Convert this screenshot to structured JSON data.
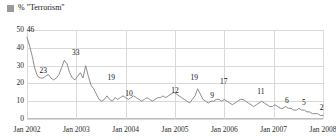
{
  "legend": {
    "label": "% \"Terrorism\"",
    "swatch_color": "#9a9a9a",
    "position": "top-left"
  },
  "chart_data": {
    "type": "line",
    "title": "",
    "subtitle": "",
    "xlabel": "",
    "ylabel": "",
    "ylim": [
      0,
      50
    ],
    "yticks": [
      0,
      10,
      20,
      30,
      40,
      50
    ],
    "xlim": [
      "Jan 2002",
      "Jan 2008"
    ],
    "xticks": [
      "Jan 2002",
      "Jan 2003",
      "Jan 2004",
      "Jan 2005",
      "Jan 2006",
      "Jan 2007",
      "Jan 2008"
    ],
    "grid": true,
    "legend_position": "top-left",
    "line_color": "#8d8d8d",
    "series": [
      {
        "name": "% \"Terrorism\"",
        "values": [
          46,
          41,
          35,
          28,
          24,
          23,
          23,
          24,
          25,
          23,
          22,
          23,
          25,
          29,
          33,
          31,
          26,
          23,
          22,
          24,
          26,
          23,
          30,
          24,
          19,
          17,
          14,
          11,
          10,
          11,
          13,
          11,
          10,
          12,
          11,
          12,
          13,
          12,
          11,
          12,
          13,
          12,
          11,
          10,
          11,
          12,
          11,
          10,
          11,
          12,
          12,
          13,
          12,
          13,
          14,
          15,
          14,
          13,
          12,
          11,
          10,
          9,
          11,
          13,
          17,
          14,
          11,
          10,
          9,
          10,
          10,
          11,
          11,
          10,
          11,
          10,
          9,
          8,
          9,
          10,
          11,
          11,
          10,
          9,
          8,
          7,
          8,
          9,
          10,
          9,
          8,
          7,
          7,
          8,
          7,
          6,
          6,
          7,
          6,
          6,
          5,
          5,
          6,
          5,
          5,
          4,
          4,
          3,
          3,
          3,
          2,
          2
        ]
      }
    ],
    "data_labels": [
      {
        "text": "46",
        "value": 46,
        "x_frac": 0.012
      },
      {
        "text": "23",
        "value": 23,
        "x_frac": 0.055
      },
      {
        "text": "33",
        "value": 33,
        "x_frac": 0.165
      },
      {
        "text": "19",
        "value": 19,
        "x_frac": 0.285
      },
      {
        "text": "10",
        "value": 10,
        "x_frac": 0.345
      },
      {
        "text": "12",
        "value": 12,
        "x_frac": 0.5
      },
      {
        "text": "19",
        "value": 19,
        "x_frac": 0.565
      },
      {
        "text": "9",
        "value": 9,
        "x_frac": 0.625
      },
      {
        "text": "17",
        "value": 17,
        "x_frac": 0.665
      },
      {
        "text": "11",
        "value": 11,
        "x_frac": 0.79
      },
      {
        "text": "6",
        "value": 6,
        "x_frac": 0.878
      },
      {
        "text": "5",
        "value": 5,
        "x_frac": 0.935
      },
      {
        "text": "2",
        "value": 2,
        "x_frac": 0.995
      }
    ]
  }
}
